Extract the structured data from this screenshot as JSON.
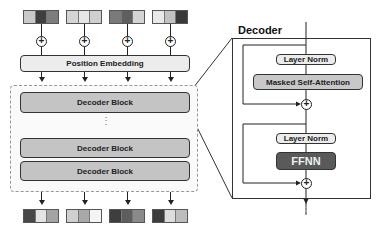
{
  "diagram": {
    "input_tokens": [
      {
        "cells": [
          "#c9c9c9",
          "#3f3f3f",
          "#7d7d7d"
        ]
      },
      {
        "cells": [
          "#d4d4d4",
          "#e6e6e6",
          "#cfcfcf"
        ]
      },
      {
        "cells": [
          "#7a7a7a",
          "#5f5f5f",
          "#d4d4d4"
        ]
      },
      {
        "cells": [
          "#e8e8e8",
          "#c2c2c2",
          "#3a3a3a"
        ]
      }
    ],
    "position_embedding_label": "Position Embedding",
    "decoder_blocks": [
      "Decoder Block",
      "Decoder Block",
      "Decoder Block"
    ],
    "ellipsis": "⋮",
    "output_tokens": [
      {
        "cells": [
          "#474747",
          "#e4e4e4",
          "#a4a4a4"
        ]
      },
      {
        "cells": [
          "#d0d0d0",
          "#a8a8a8",
          "#f4f4f4"
        ]
      },
      {
        "cells": [
          "#3e3e3e",
          "#5e5e5e",
          "#8a8a8a"
        ]
      },
      {
        "cells": [
          "#3c3c3c",
          "#dedede",
          "#bdbdbd"
        ]
      }
    ],
    "decoder_detail": {
      "title": "Decoder",
      "layer_norm_1": "Layer Norm",
      "masked_self_attention": "Masked Self-Attention",
      "layer_norm_2": "Layer Norm",
      "ffnn": "FFNN",
      "add_symbol": "+"
    }
  }
}
